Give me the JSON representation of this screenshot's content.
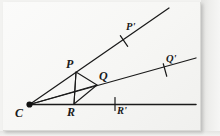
{
  "figure": {
    "background_color": "#f6f6f4",
    "ink_color": "#1a1a1a",
    "vertex": {
      "label": "C",
      "x": 29.5,
      "y": 104.5
    },
    "points": [
      {
        "name": "P",
        "label": "P",
        "x": 76,
        "y": 72,
        "label_x": 66,
        "label_y": 58,
        "size": "lg"
      },
      {
        "name": "Q",
        "label": "Q",
        "x": 97,
        "y": 85,
        "label_x": 99,
        "label_y": 70,
        "size": "lg"
      },
      {
        "name": "R",
        "label": "R",
        "x": 74,
        "y": 104,
        "label_x": 67,
        "label_y": 106,
        "size": "lg"
      },
      {
        "name": "Pp",
        "label": "P'",
        "x": 124,
        "y": 41,
        "label_x": 126,
        "label_y": 22,
        "size": "md"
      },
      {
        "name": "Qp",
        "label": "Q'",
        "x": 165,
        "y": 70,
        "label_x": 166,
        "label_y": 54,
        "size": "md"
      },
      {
        "name": "Rp",
        "label": "R'",
        "x": 115,
        "y": 104,
        "label_x": 117,
        "label_y": 106,
        "size": "md"
      }
    ],
    "rays": [
      {
        "name": "upper-ray",
        "x1": 29.5,
        "y1": 104.5,
        "x2": 169,
        "y2": 8
      },
      {
        "name": "middle-ray",
        "x1": 29.5,
        "y1": 104.5,
        "x2": 196,
        "y2": 58
      },
      {
        "name": "baseline-ray",
        "x1": 29.5,
        "y1": 104.5,
        "x2": 196,
        "y2": 104.5
      }
    ],
    "triangle": {
      "name": "triangle-PQR",
      "vertices": [
        [
          76,
          72
        ],
        [
          97,
          85
        ],
        [
          74,
          104
        ]
      ]
    },
    "segments": [
      {
        "name": "segment-C-to-Q",
        "x1": 29.5,
        "y1": 104.5,
        "x2": 97,
        "y2": 85
      },
      {
        "name": "segment-P-to-R",
        "x1": 76,
        "y1": 72,
        "x2": 74,
        "y2": 104
      }
    ],
    "tick_marks": [
      {
        "name": "tick-P-prime",
        "cx": 124,
        "cy": 41,
        "angle_deg": -34.6
      },
      {
        "name": "tick-Q-prime",
        "cx": 165,
        "cy": 70,
        "angle_deg": -15.5
      },
      {
        "name": "tick-R-prime",
        "cx": 115,
        "cy": 104,
        "angle_deg": 0
      }
    ],
    "labels": {
      "C": "C",
      "P": "P",
      "Q": "Q",
      "R": "R",
      "P_prime": "P'",
      "Q_prime": "Q'",
      "R_prime": "R'"
    }
  }
}
